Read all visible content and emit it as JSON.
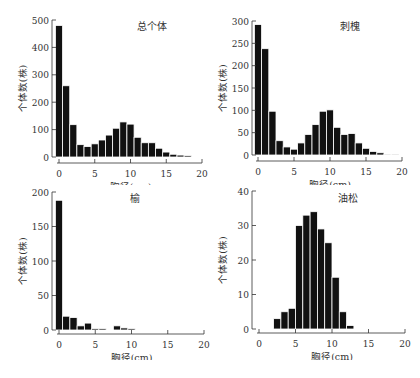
{
  "chart_data": [
    {
      "type": "bar",
      "title": "总个体",
      "xlabel": "胸径(cm)",
      "ylabel": "个体数(株)",
      "xlim": [
        0,
        20
      ],
      "ylim": [
        0,
        500
      ],
      "xticks": [
        0,
        5,
        10,
        15,
        20
      ],
      "yticks": [
        0,
        100,
        200,
        300,
        400,
        500
      ],
      "bin_width": 1,
      "categories": [
        0,
        1,
        2,
        3,
        4,
        5,
        6,
        7,
        8,
        9,
        10,
        11,
        12,
        13,
        14,
        15,
        16,
        17,
        18
      ],
      "values": [
        480,
        260,
        118,
        45,
        38,
        48,
        62,
        80,
        105,
        128,
        120,
        72,
        52,
        52,
        32,
        18,
        10,
        7,
        5
      ],
      "grid": false
    },
    {
      "type": "bar",
      "title": "刺槐",
      "xlabel": "胸径(cm)",
      "ylabel": "个体数(株)",
      "xlim": [
        0,
        20
      ],
      "ylim": [
        0,
        300
      ],
      "xticks": [
        0,
        5,
        10,
        15,
        20
      ],
      "yticks": [
        0,
        50,
        100,
        150,
        200,
        250,
        300
      ],
      "bin_width": 1,
      "categories": [
        0,
        1,
        2,
        3,
        4,
        5,
        6,
        7,
        8,
        9,
        10,
        11,
        12,
        13,
        14,
        15,
        16,
        17,
        18,
        19
      ],
      "values": [
        292,
        238,
        98,
        32,
        18,
        13,
        27,
        46,
        68,
        98,
        101,
        62,
        46,
        48,
        27,
        15,
        8,
        5,
        2,
        2
      ],
      "grid": false
    },
    {
      "type": "bar",
      "title": "榆",
      "xlabel": "胸径(cm)",
      "ylabel": "个体数(株)",
      "xlim": [
        0,
        20
      ],
      "ylim": [
        0,
        200
      ],
      "xticks": [
        0,
        5,
        10,
        15,
        20
      ],
      "yticks": [
        0,
        50,
        100,
        150,
        200
      ],
      "bin_width": 1,
      "categories": [
        0,
        1,
        2,
        3,
        4,
        5,
        6,
        7,
        8,
        9,
        10
      ],
      "values": [
        188,
        20,
        18,
        6,
        10,
        2,
        2,
        0,
        6,
        3,
        2
      ],
      "grid": false
    },
    {
      "type": "bar",
      "title": "油松",
      "xlabel": "胸径(cm)",
      "ylabel": "个体数(株)",
      "xlim": [
        0,
        20
      ],
      "ylim": [
        0,
        40
      ],
      "xticks": [
        0,
        5,
        10,
        15,
        20
      ],
      "yticks": [
        0,
        10,
        20,
        30,
        40
      ],
      "bin_width": 1,
      "categories": [
        2,
        3,
        4,
        5,
        6,
        7,
        8,
        9,
        10,
        11,
        12
      ],
      "values": [
        3,
        5,
        6,
        30,
        33,
        34,
        29,
        25,
        15,
        5,
        1
      ],
      "grid": false
    }
  ],
  "panels": [
    {
      "title": "总个体",
      "xlabel": "胸径(cm)",
      "ylabel": "个体数(株)"
    },
    {
      "title": "刺槐",
      "xlabel": "胸径(cm)",
      "ylabel": "个体数(株)"
    },
    {
      "title": "榆",
      "xlabel": "胸径(cm)",
      "ylabel": "个体数(株)"
    },
    {
      "title": "油松",
      "xlabel": "胸径(cm)",
      "ylabel": "个体数(株)"
    }
  ],
  "colors": {
    "bar": "#111111",
    "bar_edge": "#ffffff",
    "axis": "#333333",
    "text": "#333333"
  }
}
